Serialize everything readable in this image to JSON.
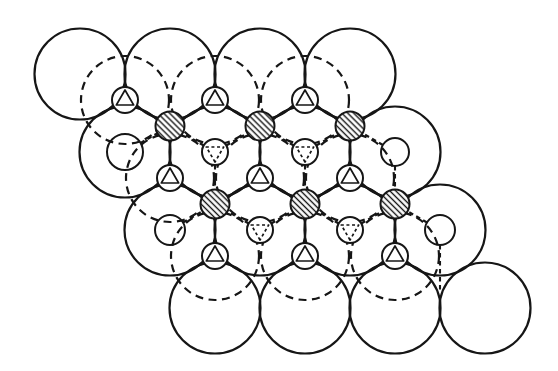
{
  "figure": {
    "canvas": {
      "width": 558,
      "height": 371,
      "background": "#ffffff"
    },
    "style": {
      "line_color": "#161616",
      "big_radius": 45.5,
      "big_dashed_radius": 44,
      "big_stroke": 2.2,
      "big_dash_pattern": "8 5.5",
      "small_stroke": 2,
      "small_radius_triangle": 13,
      "small_radius_hatched": 14.5,
      "bond_stroke": 2.1,
      "bond_dash_pattern": "4.5 3.5",
      "triangle_radius": 10,
      "triangle_stroke": 1.7,
      "triangle_dash_pattern": "3 2.6",
      "hatch_spacing": 4.2,
      "hatch_stroke": 1.4,
      "hatch_angle": -45
    },
    "large_circles_solid": [
      [
        80,
        74
      ],
      [
        170,
        74
      ],
      [
        260,
        74
      ],
      [
        350,
        74
      ],
      [
        125,
        152
      ],
      [
        215,
        152
      ],
      [
        305,
        152
      ],
      [
        395,
        152
      ],
      [
        170,
        230
      ],
      [
        260,
        230
      ],
      [
        350,
        230
      ],
      [
        440,
        230
      ],
      [
        215,
        308
      ],
      [
        305,
        308
      ],
      [
        395,
        308
      ],
      [
        485,
        308
      ]
    ],
    "large_circles_dashed": [
      [
        125,
        100
      ],
      [
        215,
        100
      ],
      [
        305,
        100
      ],
      [
        170,
        178
      ],
      [
        260,
        178
      ],
      [
        350,
        178
      ],
      [
        215,
        256
      ],
      [
        305,
        256
      ],
      [
        395,
        256
      ]
    ],
    "small_circles_triangle_up": [
      [
        125,
        100
      ],
      [
        215,
        100
      ],
      [
        305,
        100
      ],
      [
        170,
        178
      ],
      [
        260,
        178
      ],
      [
        350,
        178
      ],
      [
        215,
        256
      ],
      [
        305,
        256
      ],
      [
        395,
        256
      ]
    ],
    "small_circles_triangle_down_dashed": [
      [
        215,
        152
      ],
      [
        305,
        152
      ],
      [
        260,
        230
      ],
      [
        350,
        230
      ]
    ],
    "small_circles_plain": [
      [
        125,
        152,
        18
      ],
      [
        395,
        152,
        14
      ],
      [
        170,
        230,
        15
      ],
      [
        440,
        230,
        15
      ]
    ],
    "small_circles_hatched": [
      [
        170,
        126
      ],
      [
        260,
        126
      ],
      [
        350,
        126
      ],
      [
        215,
        204
      ],
      [
        305,
        204
      ],
      [
        395,
        204
      ]
    ],
    "bonds_solid": [
      [
        125,
        100,
        125,
        74
      ],
      [
        215,
        100,
        215,
        74
      ],
      [
        305,
        100,
        305,
        74
      ],
      [
        170,
        178,
        170,
        126
      ],
      [
        260,
        178,
        260,
        126
      ],
      [
        350,
        178,
        350,
        126
      ],
      [
        215,
        256,
        215,
        204
      ],
      [
        305,
        256,
        305,
        204
      ],
      [
        395,
        256,
        395,
        204
      ],
      [
        125,
        100,
        102.5,
        113
      ],
      [
        125,
        100,
        170,
        126
      ],
      [
        215,
        100,
        170,
        126
      ],
      [
        215,
        100,
        260,
        126
      ],
      [
        305,
        100,
        260,
        126
      ],
      [
        305,
        100,
        350,
        126
      ],
      [
        170,
        178,
        147.5,
        191
      ],
      [
        170,
        178,
        215,
        204
      ],
      [
        260,
        178,
        215,
        204
      ],
      [
        260,
        178,
        305,
        204
      ],
      [
        350,
        178,
        305,
        204
      ],
      [
        350,
        178,
        395,
        204
      ],
      [
        215,
        256,
        192.5,
        269
      ],
      [
        215,
        256,
        237.5,
        269
      ],
      [
        305,
        256,
        282.5,
        269
      ],
      [
        305,
        256,
        327.5,
        269
      ],
      [
        395,
        256,
        372.5,
        269
      ],
      [
        395,
        256,
        417.5,
        269
      ]
    ],
    "bonds_dashed": [
      [
        215,
        152,
        170,
        126
      ],
      [
        215,
        152,
        260,
        126
      ],
      [
        215,
        152,
        215,
        204
      ],
      [
        305,
        152,
        260,
        126
      ],
      [
        305,
        152,
        350,
        126
      ],
      [
        305,
        152,
        305,
        204
      ],
      [
        125,
        152,
        170,
        126
      ],
      [
        395,
        152,
        350,
        126
      ],
      [
        395,
        152,
        395,
        204
      ],
      [
        260,
        230,
        215,
        204
      ],
      [
        260,
        230,
        305,
        204
      ],
      [
        350,
        230,
        305,
        204
      ],
      [
        350,
        230,
        395,
        204
      ],
      [
        170,
        230,
        215,
        204
      ],
      [
        440,
        230,
        395,
        204
      ],
      [
        440,
        230,
        440,
        293
      ]
    ]
  }
}
